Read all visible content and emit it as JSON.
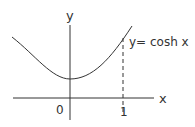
{
  "diagram": {
    "curve_label": "y= cosh x",
    "axis_labels": {
      "x": "x",
      "y": "y"
    },
    "tick_labels": {
      "origin": "0",
      "one": "1"
    },
    "colors": {
      "stroke": "#333333",
      "background": "#ffffff"
    }
  }
}
